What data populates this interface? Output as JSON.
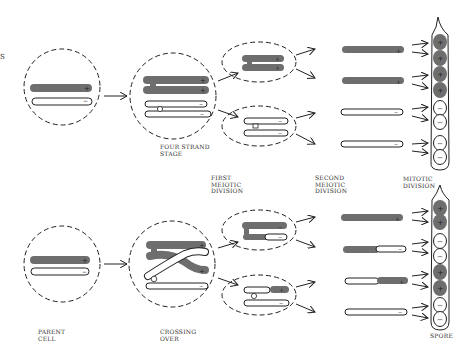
{
  "diagram": {
    "title_fragment": "S",
    "colors": {
      "dark_chromosome": "#6e6e6e",
      "outline": "#222222",
      "background": "#ffffff"
    },
    "stage_labels": {
      "four_strand": "FOUR STRAND\nSTAGE",
      "first_meiotic": "FIRST\nMEIOTIC\nDIVISION",
      "second_meiotic": "SECOND\nMEIOTIC\nDIVISION",
      "mitotic": "MITOTIC\nDIVISION",
      "parent_cell": "PARENT\nCELL",
      "crossing_over": "CROSSING\nOVER",
      "spore": "SPORE"
    },
    "rows": [
      {
        "name": "no crossing over",
        "second_meiotic_products": [
          "+",
          "+",
          "-",
          "-"
        ],
        "ascus_spores": [
          "+",
          "+",
          "+",
          "+",
          "-",
          "-",
          "-",
          "-"
        ]
      },
      {
        "name": "crossing over",
        "second_meiotic_products": [
          "+",
          "-",
          "+",
          "-"
        ],
        "ascus_spores": [
          "+",
          "+",
          "-",
          "-",
          "+",
          "+",
          "-",
          "-"
        ]
      }
    ],
    "signs": {
      "plus": "+",
      "minus": "−"
    }
  }
}
